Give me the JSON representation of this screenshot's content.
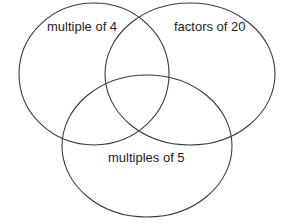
{
  "diagram": {
    "type": "venn",
    "sets": [
      {
        "id": "a",
        "label": "multiple of 4"
      },
      {
        "id": "b",
        "label": "factors of 20"
      },
      {
        "id": "c",
        "label": "multiples of 5"
      }
    ],
    "colors": {
      "stroke": "#3a3a3a",
      "text": "#1e1e1e",
      "background": "#ffffff"
    }
  }
}
